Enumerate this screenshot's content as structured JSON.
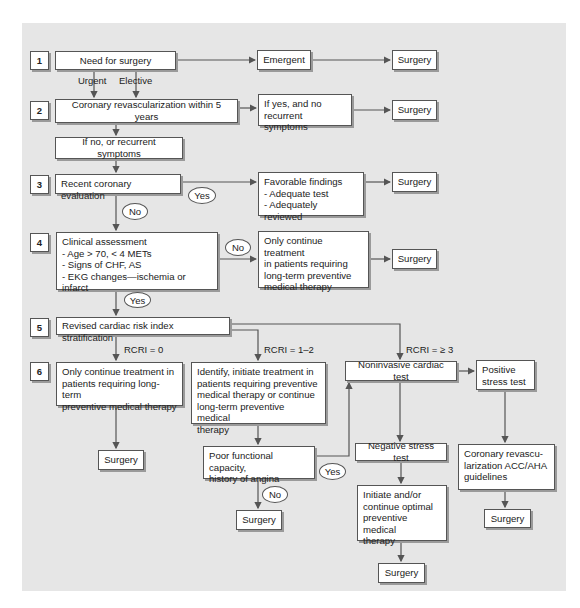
{
  "colors": {
    "panel_bg": "#e6e6e6",
    "box_bg": "#ffffff",
    "line": "#555555"
  },
  "steps": [
    "1",
    "2",
    "3",
    "4",
    "5",
    "6"
  ],
  "nodes": {
    "need_surgery": "Need for surgery",
    "emergent": "Emergent",
    "surgery_1": "Surgery",
    "revasc_5y": "Coronary revascularization within 5 years",
    "if_yes_no_symptoms": "If yes, and no\nrecurrent symptoms",
    "surgery_2": "Surgery",
    "if_no_recurrent": "If no, or recurrent symptoms",
    "recent_eval": "Recent coronary evaluation",
    "favorable": "Favorable findings\n- Adequate test\n- Adequately reviewed",
    "surgery_3": "Surgery",
    "clinical": "Clinical assessment\n- Age > 70, < 4 METs\n- Signs of CHF, AS\n- EKG changes—ischemia or infarct",
    "only_continue_4": "Only continue treatment\nin patients requiring\nlong-term preventive\nmedical therapy",
    "surgery_4": "Surgery",
    "rcri_strat": "Revised cardiac risk index stratification",
    "only_continue_6": "Only continue treatment in\npatients requiring long-term\npreventive medical therapy",
    "identify_initiate": "Identify, initiate treatment in\npatients requiring preventive\nmedical therapy or continue\nlong-term preventive medical\ntherapy",
    "noninvasive": "Noninvasive cardiac test",
    "positive": "Positive\nstress test",
    "surgery_6a": "Surgery",
    "poor_functional": "Poor functional capacity,\nhistory of angina",
    "negative": "Negative stress test",
    "coronary_revasc_guidelines": "Coronary revascu-\nlarization ACC/AHA\nguidelines",
    "surgery_6b": "Surgery",
    "initiate_optimal": "Initiate and/or\ncontinue optimal\npreventive medical\ntherapy",
    "surgery_6c": "Surgery",
    "surgery_6d": "Surgery"
  },
  "labels": {
    "urgent": "Urgent",
    "elective": "Elective",
    "yes_3": "Yes",
    "no_3": "No",
    "no_4": "No",
    "yes_4": "Yes",
    "rcri_0": "RCRI = 0",
    "rcri_12": "RCRI = 1–2",
    "rcri_3": "RCRI = ≥ 3",
    "yes_poor": "Yes",
    "no_poor": "No"
  }
}
